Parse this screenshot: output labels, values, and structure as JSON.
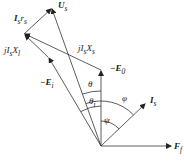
{
  "diagram": {
    "type": "phasor-diagram",
    "origin": [
      101,
      146
    ],
    "vectors": [
      {
        "name": "U_s",
        "label": "U",
        "sub": "s",
        "from": [
          101,
          146
        ],
        "to": [
          52,
          8
        ]
      },
      {
        "name": "-E_i",
        "label": "−E",
        "sub": "i",
        "from": [
          101,
          146
        ],
        "to": [
          48,
          57
        ]
      },
      {
        "name": "-E_0",
        "label": "−E",
        "sub": "0",
        "from": [
          101,
          146
        ],
        "to": [
          101,
          70
        ]
      },
      {
        "name": "I_s",
        "label": "I",
        "sub": "s",
        "from": [
          101,
          146
        ],
        "to": [
          146,
          103
        ]
      },
      {
        "name": "F_f",
        "label": "F",
        "sub": "f",
        "from": [
          101,
          146
        ],
        "to": [
          172,
          146
        ]
      },
      {
        "name": "jI_sX_s",
        "label": "jI",
        "sub": "s",
        "tail": "X",
        "tailsub": "s",
        "from": [
          101,
          70
        ],
        "to": [
          24,
          34
        ]
      },
      {
        "name": "jI_sX_l",
        "label": "jI",
        "sub": "s",
        "tail": "X",
        "tailsub": "l",
        "from": [
          48,
          57
        ],
        "to": [
          24,
          34
        ]
      },
      {
        "name": "I_sr_s",
        "label": "I",
        "sub": "s",
        "tail": "r",
        "tailsub": "s",
        "from": [
          24,
          34
        ],
        "to": [
          52,
          8
        ]
      }
    ],
    "angles": [
      "θ",
      "θ_i",
      "φ",
      "ψ"
    ]
  },
  "labels": {
    "Us": "U",
    "Us_sub": "s",
    "Isrs": "I",
    "Isrs_sub": "s",
    "Isrs_r": "r",
    "Isrs_rsub": "s",
    "jIsXl": "jI",
    "jIsXl_sub": "s",
    "jIsXl_X": "X",
    "jIsXl_Xsub": "l",
    "jIsXs": "jI",
    "jIsXs_sub": "s",
    "jIsXs_X": "X",
    "jIsXs_Xsub": "s",
    "E0": "−E",
    "E0_sub": "0",
    "Ei": "−E",
    "Ei_sub": "i",
    "Is": "I",
    "Is_sub": "s",
    "Ff": "F",
    "Ff_sub": "f",
    "theta": "θ",
    "theta_i": "θ",
    "theta_i_sub": "i",
    "phi": "φ",
    "psi": "ψ"
  }
}
